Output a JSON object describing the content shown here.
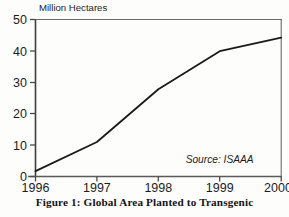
{
  "figure": {
    "caption": "Figure 1: Global Area Planted to Transgenic"
  },
  "chart_data": {
    "type": "line",
    "title": "",
    "subtitle": "",
    "xlabel": "",
    "ylabel": "Million Hectares",
    "ylabel_position": "above-axis-top-left",
    "x": [
      1996,
      1997,
      1998,
      1999,
      2000
    ],
    "xtick_labels": [
      "1996",
      "1997",
      "1998",
      "1999",
      "2000"
    ],
    "values": [
      1.7,
      11.0,
      27.8,
      39.9,
      44.2
    ],
    "series": [
      {
        "name": "Global area planted to transgenic crops",
        "values": [
          1.7,
          11.0,
          27.8,
          39.9,
          44.2
        ]
      }
    ],
    "xlim": [
      1996,
      2000
    ],
    "ylim": [
      0,
      50
    ],
    "ytick_labels": [
      "0",
      "10",
      "20",
      "30",
      "40",
      "50"
    ],
    "yticks": [
      0,
      10,
      20,
      30,
      40,
      50
    ],
    "grid": false,
    "legend": false,
    "legend_position": "none",
    "annotations": [
      {
        "name": "source-note",
        "text": "Source:  ISAAA",
        "style": "italic",
        "x": 1999.55,
        "y": 4.2
      }
    ],
    "line_color": "#1a1a1a",
    "line_width": 1.8,
    "axis_color": "#4a4a4a",
    "background_color": "#fdfdfc"
  }
}
